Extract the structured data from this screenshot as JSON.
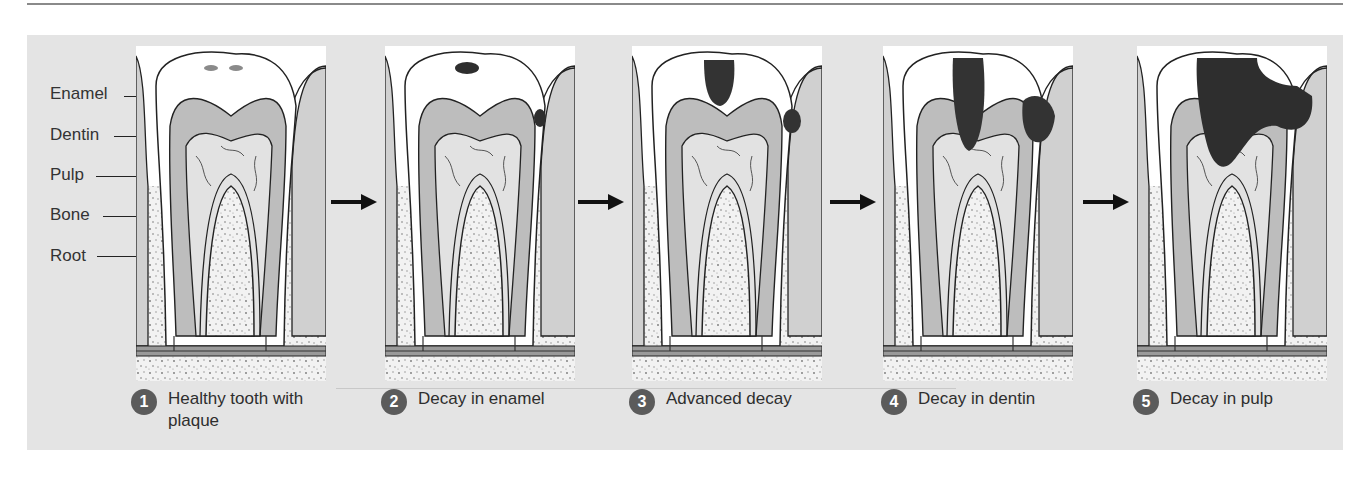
{
  "figure": {
    "colors": {
      "panel_bg": "#e4e4e4",
      "badge": "#5b5b5b",
      "dentin": "#b9b9b9",
      "enamel": "#ffffff",
      "decay": "#3a3a3a",
      "bone_speckle": "#7a7a7a"
    },
    "anatomy_labels": [
      {
        "label": "Enamel"
      },
      {
        "label": "Dentin"
      },
      {
        "label": "Pulp"
      },
      {
        "label": "Bone"
      },
      {
        "label": "Root"
      }
    ],
    "decay_callout": "Decay",
    "stages": [
      {
        "number": "1",
        "caption_line1": "Healthy tooth with",
        "caption_line2": "plaque"
      },
      {
        "number": "2",
        "caption_line1": "Decay in enamel",
        "caption_line2": ""
      },
      {
        "number": "3",
        "caption_line1": "Advanced decay",
        "caption_line2": ""
      },
      {
        "number": "4",
        "caption_line1": "Decay in dentin",
        "caption_line2": ""
      },
      {
        "number": "5",
        "caption_line1": "Decay in pulp",
        "caption_line2": ""
      }
    ],
    "arrow_icon": "right-arrow-icon"
  }
}
